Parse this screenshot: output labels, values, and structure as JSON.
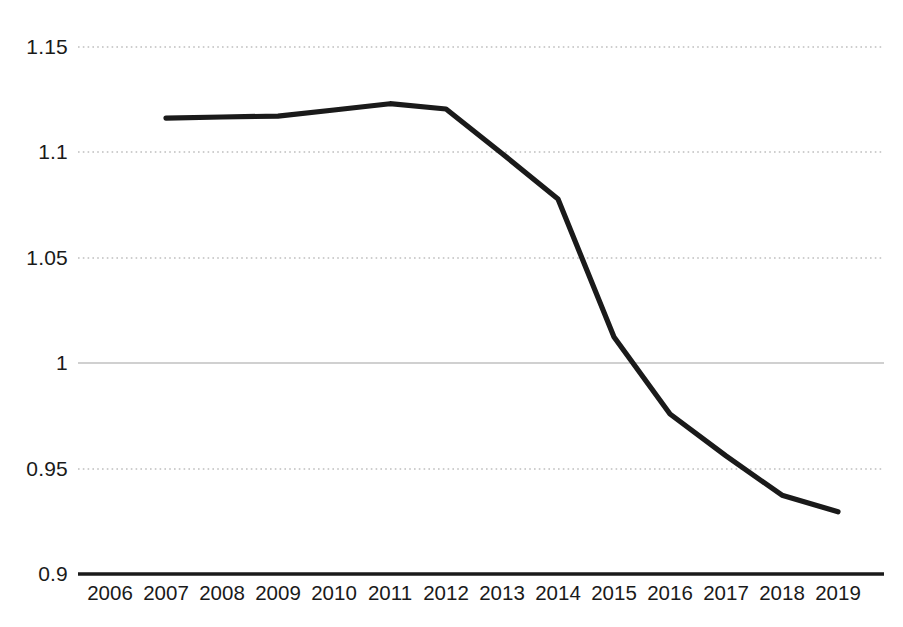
{
  "chart_data": {
    "type": "line",
    "title": "",
    "subtitle": "",
    "xlabel": "",
    "ylabel": "",
    "categories": [
      "2006",
      "2007",
      "2008",
      "2009",
      "2010",
      "2011",
      "2012",
      "2013",
      "2014",
      "2015",
      "2016",
      "2017",
      "2018",
      "2019"
    ],
    "series": [
      {
        "name": "series-1",
        "color": "#1a1a1a",
        "values": [
          null,
          1.1163,
          1.1168,
          1.1172,
          1.1201,
          1.1231,
          1.1206,
          1.0995,
          1.0779,
          1.0124,
          0.9759,
          0.956,
          0.9374,
          0.9295
        ]
      }
    ],
    "ylim": [
      0.9,
      1.15
    ],
    "yticks": [
      0.9,
      0.95,
      1.0,
      1.05,
      1.1,
      1.15
    ],
    "ytick_labels": [
      "0.9",
      "0.95",
      "1",
      "1.05",
      "1.1",
      "1.15"
    ],
    "xtick_labels": [
      "2006",
      "2007",
      "2008",
      "2009",
      "2010",
      "2011",
      "2012",
      "2013",
      "2014",
      "2015",
      "2016",
      "2017",
      "2018",
      "2019"
    ],
    "grid": true,
    "grid_style": "dotted",
    "grid_color": "#bfbfbf",
    "axis_line_color": "#1a1a1a",
    "legend": false,
    "legend_position": "none",
    "annotations": []
  },
  "axes": {
    "y_labels": [
      "1.15",
      "1.1",
      "1.05",
      "1",
      "0.95",
      "0.9"
    ],
    "x_labels": [
      "2006",
      "2007",
      "2008",
      "2009",
      "2010",
      "2011",
      "2012",
      "2013",
      "2014",
      "2015",
      "2016",
      "2017",
      "2018",
      "2019"
    ]
  },
  "colors": {
    "line": "#1a1a1a",
    "grid": "#bfbfbf",
    "baseline": "#1a1a1a",
    "text": "#1a1a1a",
    "background": "#ffffff"
  }
}
